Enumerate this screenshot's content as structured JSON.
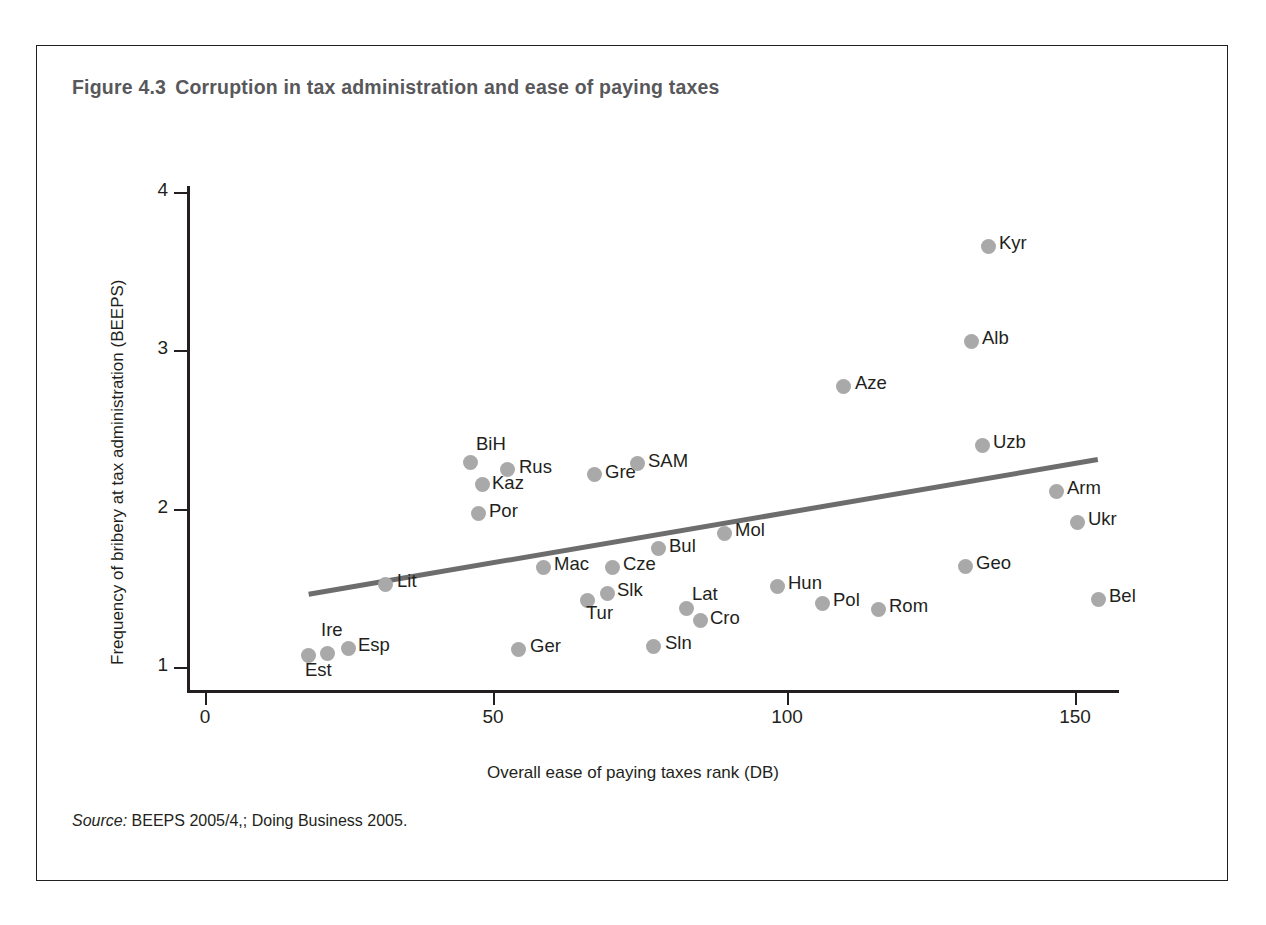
{
  "figure": {
    "number": "Figure 4.3",
    "title": "Corruption in tax administration and ease of paying taxes",
    "source": "BEEPS 2005/4,; Doing Business 2005.",
    "source_prefix": "Source:"
  },
  "chart_data": {
    "type": "scatter",
    "title": "Corruption in tax administration and ease of paying taxes",
    "xlabel": "Overall ease of paying taxes rank (DB)",
    "ylabel": "Frequency of bribery at tax administration (BEEPS)",
    "xlim": [
      0,
      160
    ],
    "ylim": [
      1,
      4
    ],
    "xticks": [
      0,
      50,
      100,
      150
    ],
    "yticks": [
      1,
      2,
      3,
      4
    ],
    "grid": false,
    "legend": "none",
    "marker_color": "#a9a9a9",
    "trendline_color": "#6d6d6d",
    "trendline": {
      "x0": 18,
      "y0": 1.46,
      "x1": 155,
      "y1": 2.31
    },
    "points": [
      {
        "label": "Est",
        "x": 18,
        "y": 1.17,
        "lx": 308,
        "ly": 655,
        "tx": 305,
        "ty": 659
      },
      {
        "label": "Ire",
        "x": 21,
        "y": 1.18,
        "lx": 327,
        "ly": 653,
        "tx": 321,
        "ty": 619
      },
      {
        "label": "Esp",
        "x": 25,
        "y": 1.21,
        "lx": 348,
        "ly": 648,
        "tx": 358,
        "ty": 634
      },
      {
        "label": "Lit",
        "x": 31,
        "y": 1.58,
        "lx": 385,
        "ly": 584,
        "tx": 397,
        "ty": 570
      },
      {
        "label": "BiH",
        "x": 46,
        "y": 2.36,
        "lx": 470,
        "ly": 462,
        "tx": 476,
        "ty": 433
      },
      {
        "label": "Por",
        "x": 47,
        "y": 2.04,
        "lx": 478,
        "ly": 513,
        "tx": 489,
        "ty": 500
      },
      {
        "label": "Kaz",
        "x": 48,
        "y": 2.22,
        "lx": 482,
        "ly": 484,
        "tx": 492,
        "ty": 472
      },
      {
        "label": "Rus",
        "x": 52,
        "y": 2.32,
        "lx": 507,
        "ly": 469,
        "tx": 519,
        "ty": 456
      },
      {
        "label": "Ger",
        "x": 54,
        "y": 1.2,
        "lx": 518,
        "ly": 649,
        "tx": 530,
        "ty": 635
      },
      {
        "label": "Mac",
        "x": 58,
        "y": 1.69,
        "lx": 543,
        "ly": 567,
        "tx": 554,
        "ty": 553
      },
      {
        "label": "Tur",
        "x": 66,
        "y": 1.49,
        "lx": 587,
        "ly": 600,
        "tx": 586,
        "ty": 602
      },
      {
        "label": "Gre",
        "x": 67,
        "y": 2.27,
        "lx": 594,
        "ly": 474,
        "tx": 605,
        "ty": 461
      },
      {
        "label": "Slk",
        "x": 69,
        "y": 1.52,
        "lx": 607,
        "ly": 593,
        "tx": 617,
        "ty": 579
      },
      {
        "label": "Cze",
        "x": 70,
        "y": 1.69,
        "lx": 612,
        "ly": 567,
        "tx": 623,
        "ty": 553
      },
      {
        "label": "SAM",
        "x": 74,
        "y": 2.35,
        "lx": 637,
        "ly": 463,
        "tx": 648,
        "ty": 450
      },
      {
        "label": "Sln",
        "x": 77,
        "y": 1.21,
        "lx": 653,
        "ly": 646,
        "tx": 665,
        "ty": 632
      },
      {
        "label": "Bul",
        "x": 78,
        "y": 1.8,
        "lx": 658,
        "ly": 548,
        "tx": 669,
        "ty": 535
      },
      {
        "label": "Lat",
        "x": 83,
        "y": 1.45,
        "lx": 686,
        "ly": 608,
        "tx": 692,
        "ty": 583
      },
      {
        "label": "Cro",
        "x": 85,
        "y": 1.37,
        "lx": 700,
        "ly": 620,
        "tx": 710,
        "ty": 607
      },
      {
        "label": "Mol",
        "x": 89,
        "y": 1.91,
        "lx": 724,
        "ly": 533,
        "tx": 735,
        "ty": 519
      },
      {
        "label": "Hun",
        "x": 98,
        "y": 1.57,
        "lx": 777,
        "ly": 586,
        "tx": 788,
        "ty": 572
      },
      {
        "label": "Pol",
        "x": 106,
        "y": 1.48,
        "lx": 822,
        "ly": 603,
        "tx": 833,
        "ty": 589
      },
      {
        "label": "Aze",
        "x": 110,
        "y": 2.84,
        "lx": 843,
        "ly": 386,
        "tx": 855,
        "ty": 372
      },
      {
        "label": "Rom",
        "x": 116,
        "y": 1.44,
        "lx": 878,
        "ly": 609,
        "tx": 889,
        "ty": 595
      },
      {
        "label": "Geo",
        "x": 131,
        "y": 1.71,
        "lx": 965,
        "ly": 566,
        "tx": 976,
        "ty": 552
      },
      {
        "label": "Alb",
        "x": 132,
        "y": 3.11,
        "lx": 971,
        "ly": 341,
        "tx": 982,
        "ly2": 0,
        "ty": 327
      },
      {
        "label": "Uzb",
        "x": 134,
        "y": 2.47,
        "lx": 982,
        "ly": 445,
        "tx": 993,
        "ty": 431
      },
      {
        "label": "Kyr",
        "x": 135,
        "y": 3.66,
        "lx": 988,
        "ly": 246,
        "tx": 999,
        "ty": 232
      },
      {
        "label": "Arm",
        "x": 147,
        "y": 2.18,
        "lx": 1056,
        "ly": 491,
        "tx": 1067,
        "ty": 477
      },
      {
        "label": "Ukr",
        "x": 150,
        "y": 1.99,
        "lx": 1077,
        "ly": 522,
        "tx": 1088,
        "ty": 508
      },
      {
        "label": "Bel",
        "x": 154,
        "y": 1.49,
        "lx": 1098,
        "ly": 599,
        "tx": 1109,
        "ty": 585
      }
    ]
  },
  "axes": {
    "y_ticks": [
      {
        "label": "4",
        "py": 192
      },
      {
        "label": "3",
        "py": 350
      },
      {
        "label": "2",
        "py": 509
      },
      {
        "label": "1",
        "py": 667
      }
    ],
    "x_ticks": [
      {
        "label": "0",
        "px": 205
      },
      {
        "label": "50",
        "px": 493
      },
      {
        "label": "100",
        "px": 787
      },
      {
        "label": "150",
        "px": 1075
      }
    ]
  }
}
